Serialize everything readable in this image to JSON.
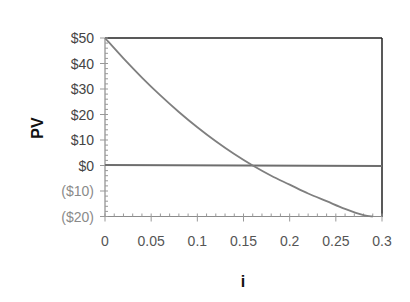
{
  "chart_data": {
    "type": "line",
    "title": "",
    "xlabel": "i",
    "ylabel": "PV",
    "xlim": [
      0,
      0.3
    ],
    "ylim": [
      -20,
      50
    ],
    "grid": false,
    "legend": null,
    "x_ticks": [
      "0",
      "0.05",
      "0.1",
      "0.15",
      "0.2",
      "0.25",
      "0.3"
    ],
    "x_tick_values": [
      0,
      0.05,
      0.1,
      0.15,
      0.2,
      0.25,
      0.3
    ],
    "y_ticks": [
      "$50",
      "$40",
      "$30",
      "$20",
      "$10",
      "$0",
      "($10)",
      "($20)"
    ],
    "y_tick_values": [
      50,
      40,
      30,
      20,
      10,
      0,
      -10,
      -20
    ],
    "reference_line": {
      "y": 0,
      "label": "zero line"
    },
    "series": [
      {
        "name": "PV",
        "color": "#7f7f7f",
        "x": [
          0,
          0.02,
          0.04,
          0.06,
          0.08,
          0.1,
          0.12,
          0.14,
          0.16,
          0.18,
          0.2,
          0.22,
          0.24,
          0.26,
          0.28,
          0.29
        ],
        "y": [
          50,
          42,
          34.5,
          27.5,
          21,
          15,
          9.5,
          4.5,
          0,
          -4,
          -7.5,
          -11,
          -14,
          -17,
          -19.5,
          -20
        ]
      }
    ],
    "annotations": [
      "PV crosses $0 at i ≈ 0.16"
    ]
  },
  "labels": {
    "ylabel": "PV",
    "xlabel": "i",
    "y_ticks": [
      "$50",
      "$40",
      "$30",
      "$20",
      "$10",
      "$0",
      "($10)",
      "($20)"
    ],
    "x_ticks": [
      "0",
      "0.05",
      "0.1",
      "0.15",
      "0.2",
      "0.25",
      "0.3"
    ]
  },
  "colors": {
    "curve": "#7f7f7f",
    "frame": "#222222",
    "zero_line": "#6e6e6e",
    "axis": "#8c8c8c"
  }
}
